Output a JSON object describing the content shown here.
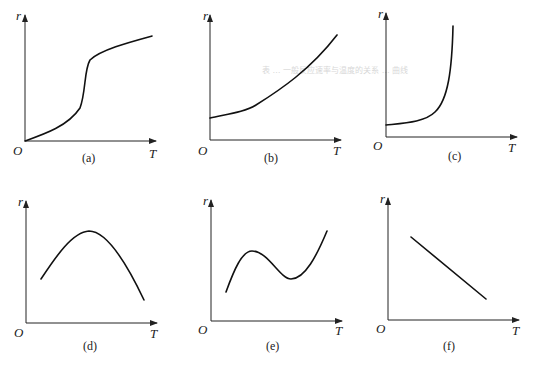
{
  "figure": {
    "watermark": "表 … 一般反应速率与温度的关系 … 曲线",
    "panels": [
      {
        "id": "a",
        "caption": "(a)",
        "y_label": "r",
        "x_label": "T",
        "origin_label": "O",
        "shape": "S-shaped rise (sigmoidal, explosive-type)"
      },
      {
        "id": "b",
        "caption": "(b)",
        "y_label": "r",
        "x_label": "T",
        "origin_label": "O",
        "shape": "monotonic accelerating rise (Arrhenius-type)"
      },
      {
        "id": "c",
        "caption": "(c)",
        "y_label": "r",
        "x_label": "T",
        "origin_label": "O",
        "shape": "slow rise then steep near-vertical increase (explosion-type)"
      },
      {
        "id": "d",
        "caption": "(d)",
        "y_label": "r",
        "x_label": "T",
        "origin_label": "O",
        "shape": "rise to maximum then fall (enzyme/catalytic-type)"
      },
      {
        "id": "e",
        "caption": "(e)",
        "y_label": "r",
        "x_label": "T",
        "origin_label": "O",
        "shape": "rise, fall, then rise again (combustion-type)"
      },
      {
        "id": "f",
        "caption": "(f)",
        "y_label": "r",
        "x_label": "T",
        "origin_label": "O",
        "shape": "linear decrease (negative temperature coefficient)"
      }
    ]
  }
}
